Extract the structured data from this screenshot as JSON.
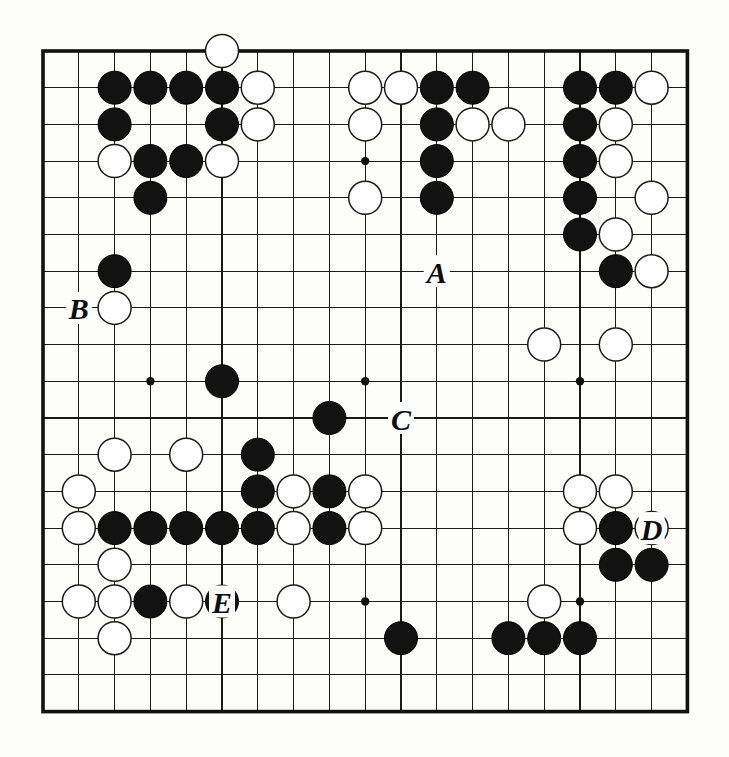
{
  "figure": {
    "kind": "go-board-diagram",
    "board_size": 19,
    "background_color": "#fdfdfb",
    "line_color": "#1a1a1a",
    "black_stone_color": "#121212",
    "white_stone_color": "#ffffff"
  },
  "geometry": {
    "origin_x": 43,
    "origin_y": 51,
    "col_step": 35.8,
    "row_step": 36.7,
    "stone_radius": 16.5,
    "hoshi_radius": 4.2
  },
  "hoshi_points": [
    {
      "col": 3,
      "row": 3
    },
    {
      "col": 9,
      "row": 3
    },
    {
      "col": 15,
      "row": 3
    },
    {
      "col": 3,
      "row": 9
    },
    {
      "col": 9,
      "row": 9
    },
    {
      "col": 15,
      "row": 9
    },
    {
      "col": 3,
      "row": 15
    },
    {
      "col": 9,
      "row": 15
    },
    {
      "col": 15,
      "row": 15
    }
  ],
  "stones": {
    "black": [
      {
        "col": 2,
        "row": 1
      },
      {
        "col": 3,
        "row": 1
      },
      {
        "col": 4,
        "row": 1
      },
      {
        "col": 5,
        "row": 1
      },
      {
        "col": 2,
        "row": 2
      },
      {
        "col": 5,
        "row": 2
      },
      {
        "col": 3,
        "row": 3
      },
      {
        "col": 4,
        "row": 3
      },
      {
        "col": 3,
        "row": 4
      },
      {
        "col": 2,
        "row": 6
      },
      {
        "col": 11,
        "row": 1
      },
      {
        "col": 12,
        "row": 1
      },
      {
        "col": 11,
        "row": 2
      },
      {
        "col": 11,
        "row": 3
      },
      {
        "col": 11,
        "row": 4
      },
      {
        "col": 15,
        "row": 1
      },
      {
        "col": 16,
        "row": 1
      },
      {
        "col": 15,
        "row": 2
      },
      {
        "col": 15,
        "row": 3
      },
      {
        "col": 15,
        "row": 4
      },
      {
        "col": 15,
        "row": 5
      },
      {
        "col": 16,
        "row": 6
      },
      {
        "col": 5,
        "row": 9
      },
      {
        "col": 8,
        "row": 10
      },
      {
        "col": 6,
        "row": 11
      },
      {
        "col": 6,
        "row": 12
      },
      {
        "col": 2,
        "row": 13
      },
      {
        "col": 3,
        "row": 13
      },
      {
        "col": 4,
        "row": 13
      },
      {
        "col": 5,
        "row": 13
      },
      {
        "col": 6,
        "row": 13
      },
      {
        "col": 8,
        "row": 13
      },
      {
        "col": 8,
        "row": 12
      },
      {
        "col": 16,
        "row": 13
      },
      {
        "col": 3,
        "row": 15
      },
      {
        "col": 5,
        "row": 15
      },
      {
        "col": 16,
        "row": 14
      },
      {
        "col": 17,
        "row": 14
      },
      {
        "col": 10,
        "row": 16
      },
      {
        "col": 13,
        "row": 16
      },
      {
        "col": 14,
        "row": 16
      },
      {
        "col": 15,
        "row": 16
      }
    ],
    "white": [
      {
        "col": 5,
        "row": 0
      },
      {
        "col": 6,
        "row": 1
      },
      {
        "col": 6,
        "row": 2
      },
      {
        "col": 2,
        "row": 3
      },
      {
        "col": 5,
        "row": 3
      },
      {
        "col": 2,
        "row": 7
      },
      {
        "col": 9,
        "row": 1
      },
      {
        "col": 10,
        "row": 1
      },
      {
        "col": 12,
        "row": 2
      },
      {
        "col": 13,
        "row": 2
      },
      {
        "col": 9,
        "row": 2
      },
      {
        "col": 9,
        "row": 4
      },
      {
        "col": 17,
        "row": 1
      },
      {
        "col": 16,
        "row": 2
      },
      {
        "col": 16,
        "row": 3
      },
      {
        "col": 17,
        "row": 4
      },
      {
        "col": 16,
        "row": 5
      },
      {
        "col": 17,
        "row": 6
      },
      {
        "col": 14,
        "row": 8
      },
      {
        "col": 16,
        "row": 8
      },
      {
        "col": 2,
        "row": 11
      },
      {
        "col": 4,
        "row": 11
      },
      {
        "col": 1,
        "row": 12
      },
      {
        "col": 7,
        "row": 12
      },
      {
        "col": 9,
        "row": 12
      },
      {
        "col": 15,
        "row": 12
      },
      {
        "col": 1,
        "row": 13
      },
      {
        "col": 7,
        "row": 13
      },
      {
        "col": 9,
        "row": 13
      },
      {
        "col": 16,
        "row": 12
      },
      {
        "col": 15,
        "row": 13
      },
      {
        "col": 2,
        "row": 14
      },
      {
        "col": 17,
        "row": 13
      },
      {
        "col": 1,
        "row": 15
      },
      {
        "col": 2,
        "row": 15
      },
      {
        "col": 4,
        "row": 15
      },
      {
        "col": 7,
        "row": 15
      },
      {
        "col": 14,
        "row": 15
      },
      {
        "col": 2,
        "row": 16
      }
    ]
  },
  "markers": [
    {
      "label": "A",
      "col": 11,
      "row": 6,
      "name": "marker-a"
    },
    {
      "label": "B",
      "col": 1,
      "row": 7,
      "name": "marker-b"
    },
    {
      "label": "C",
      "col": 10,
      "row": 10,
      "name": "marker-c"
    },
    {
      "label": "D",
      "col": 17,
      "row": 13,
      "name": "marker-d"
    },
    {
      "label": "E",
      "col": 5,
      "row": 15,
      "name": "marker-e"
    }
  ]
}
